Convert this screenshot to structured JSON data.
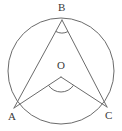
{
  "figure": {
    "type": "geometry-diagram",
    "background_color": "#ffffff",
    "stroke_color": "#6b6b6b",
    "label_color": "#3a3a3a",
    "stroke_width": 1
  },
  "labels": {
    "B": "B",
    "O": "O",
    "A": "A",
    "C": "C"
  },
  "points": {
    "B": {
      "name": "B",
      "x": 62,
      "y": 20,
      "role": "inscribed-angle-vertex-on-circle"
    },
    "O": {
      "name": "O",
      "x": 61,
      "y": 77,
      "role": "circle-center"
    },
    "A": {
      "name": "A",
      "x": 14,
      "y": 108,
      "role": "point-on-circle"
    },
    "C": {
      "name": "C",
      "x": 107,
      "y": 107,
      "role": "point-on-circle"
    }
  },
  "circle": {
    "name": "main-circle",
    "center_x": 61,
    "center_y": 71,
    "radius": 53,
    "filled": false
  },
  "segments": [
    {
      "name": "segment-BA",
      "from": "B",
      "to": "A"
    },
    {
      "name": "segment-BC",
      "from": "B",
      "to": "C"
    },
    {
      "name": "segment-OA",
      "from": "O",
      "to": "A"
    },
    {
      "name": "segment-OC",
      "from": "O",
      "to": "C"
    }
  ],
  "angle_marks": [
    {
      "name": "angle-ABC",
      "vertex": "B",
      "type": "inscribed-angle",
      "arc_radius": 13
    },
    {
      "name": "angle-AOC",
      "vertex": "O",
      "type": "central-angle",
      "arc_radius": 15
    }
  ]
}
